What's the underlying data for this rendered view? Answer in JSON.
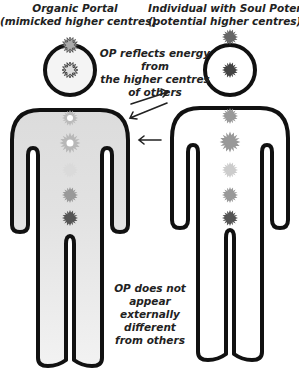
{
  "left_figure": {
    "title": "Organic Portal",
    "subtitle": "(mimicked higher centres)",
    "fill": "#e6e6e6"
  },
  "right_figure": {
    "title": "Individual with Soul Potential",
    "subtitle": "(potential higher centres)",
    "fill": "#ffffff"
  },
  "annotations": {
    "top": [
      "OP reflects energy from",
      "the higher centres",
      "of others"
    ],
    "bottom": [
      "OP does not",
      "appear externally",
      "different",
      "from others"
    ]
  },
  "arrows": [
    {
      "direction": "right",
      "label": "to-individual"
    },
    {
      "direction": "left",
      "label": "to-portal"
    },
    {
      "direction": "left",
      "label": "to-portal-lower"
    }
  ],
  "centres": [
    "crown",
    "head",
    "throat",
    "heart",
    "solar-plexus",
    "sacral",
    "root"
  ]
}
